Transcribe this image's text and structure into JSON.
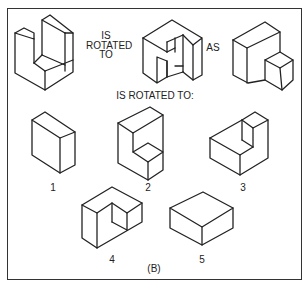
{
  "figure": {
    "prompt_text": [
      "IS",
      "ROTATED",
      "TO"
    ],
    "as_text": "AS",
    "question_text": "IS ROTATED TO:",
    "caption": "(B)",
    "options": [
      {
        "label": "1"
      },
      {
        "label": "2"
      },
      {
        "label": "3"
      },
      {
        "label": "4"
      },
      {
        "label": "5"
      }
    ],
    "colors": {
      "line": "#222222",
      "frame": "#333333",
      "background": "#ffffff"
    }
  }
}
